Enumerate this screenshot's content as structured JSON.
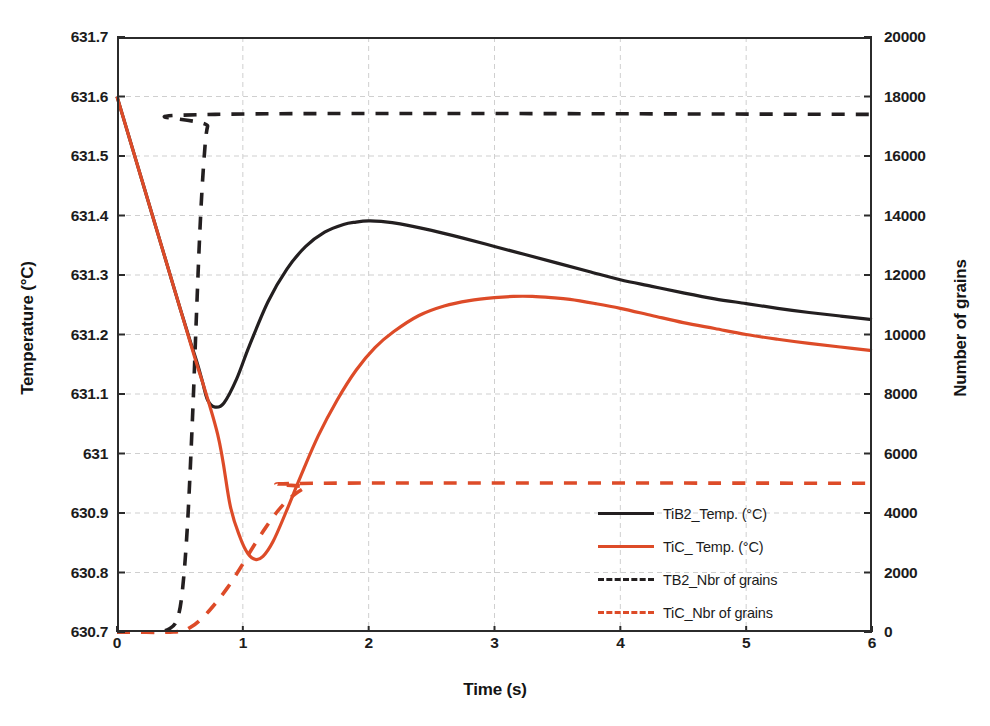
{
  "chart_data": {
    "type": "line",
    "title": "",
    "xlabel": "Time (s)",
    "ylabel": "Temperature (°C)",
    "y2label": "Number of grains",
    "xlim": [
      0,
      6
    ],
    "ylim": [
      630.7,
      631.7
    ],
    "y2lim": [
      0,
      20000
    ],
    "grid": true,
    "legend_position": "inside-right",
    "xticks": [
      "0",
      "1",
      "2",
      "3",
      "4",
      "5",
      "6"
    ],
    "xtick_values": [
      0,
      1,
      2,
      3,
      4,
      5,
      6
    ],
    "yticks": [
      "630.7",
      "630.8",
      "630.9",
      "631",
      "631.1",
      "631.2",
      "631.3",
      "631.4",
      "631.5",
      "631.6",
      "631.7"
    ],
    "ytick_values": [
      630.7,
      630.8,
      630.9,
      631.0,
      631.1,
      631.2,
      631.3,
      631.4,
      631.5,
      631.6,
      631.7
    ],
    "y2ticks": [
      "0",
      "2000",
      "4000",
      "6000",
      "8000",
      "10000",
      "12000",
      "14000",
      "16000",
      "18000",
      "20000"
    ],
    "y2tick_values": [
      0,
      2000,
      4000,
      6000,
      8000,
      10000,
      12000,
      14000,
      16000,
      18000,
      20000
    ],
    "colors": {
      "tib2": "#231f20",
      "tic": "#dd4b28",
      "axis": "#2b2b2b",
      "grid": "#cfcfcf"
    },
    "series": [
      {
        "name": "TiB2_Temp. (°C)",
        "axis": "left",
        "style": "solid",
        "color": "#231f20",
        "x": [
          0.0,
          0.1,
          0.2,
          0.3,
          0.4,
          0.5,
          0.58,
          0.64,
          0.68,
          0.72,
          0.78,
          0.85,
          0.95,
          1.05,
          1.2,
          1.35,
          1.5,
          1.65,
          1.8,
          1.9,
          2.0,
          2.1,
          2.25,
          2.5,
          2.75,
          3.0,
          3.25,
          3.5,
          3.75,
          4.0,
          4.25,
          4.5,
          4.75,
          5.0,
          5.25,
          5.5,
          5.75,
          6.0
        ],
        "y": [
          631.6,
          631.529,
          631.458,
          631.387,
          631.316,
          631.245,
          631.19,
          631.15,
          631.12,
          631.09,
          631.078,
          631.085,
          631.125,
          631.18,
          631.255,
          631.31,
          631.348,
          631.372,
          631.385,
          631.389,
          631.391,
          631.39,
          631.386,
          631.375,
          631.362,
          631.348,
          631.334,
          631.32,
          631.306,
          631.292,
          631.281,
          631.27,
          631.26,
          631.252,
          631.244,
          631.237,
          631.231,
          631.225
        ]
      },
      {
        "name": "TiC_ Temp. (°C)",
        "axis": "left",
        "style": "solid",
        "color": "#dd4b28",
        "x": [
          0.0,
          0.2,
          0.4,
          0.6,
          0.8,
          0.9,
          0.98,
          1.04,
          1.1,
          1.16,
          1.24,
          1.34,
          1.46,
          1.6,
          1.75,
          1.9,
          2.05,
          2.2,
          2.4,
          2.6,
          2.8,
          3.0,
          3.15,
          3.3,
          3.45,
          3.6,
          3.8,
          4.0,
          4.25,
          4.5,
          4.75,
          5.0,
          5.25,
          5.5,
          5.75,
          6.0
        ],
        "y": [
          631.6,
          631.458,
          631.316,
          631.174,
          631.032,
          630.912,
          630.858,
          630.832,
          630.822,
          630.827,
          630.852,
          630.9,
          630.962,
          631.03,
          631.09,
          631.14,
          631.178,
          631.205,
          631.232,
          631.248,
          631.257,
          631.262,
          631.264,
          631.264,
          631.262,
          631.259,
          631.252,
          631.244,
          631.232,
          631.22,
          631.21,
          631.2,
          631.192,
          631.185,
          631.179,
          631.173
        ]
      },
      {
        "name": "TB2_Nbr of grains",
        "axis": "right",
        "style": "dashed",
        "color": "#231f20",
        "x": [
          0.0,
          0.3,
          0.42,
          0.48,
          0.52,
          0.56,
          0.6,
          0.63,
          0.66,
          0.69,
          0.72,
          0.78,
          6.0
        ],
        "y": [
          0,
          0,
          120,
          450,
          1400,
          3600,
          7200,
          10500,
          13600,
          15800,
          17000,
          17400,
          17400
        ]
      },
      {
        "name": "TiC_Nbr of grains",
        "axis": "right",
        "style": "dashed",
        "color": "#dd4b28",
        "x": [
          0.0,
          0.45,
          0.58,
          0.68,
          0.78,
          0.88,
          0.98,
          1.08,
          1.18,
          1.28,
          1.38,
          1.5,
          1.62,
          6.0
        ],
        "y": [
          0,
          0,
          150,
          480,
          950,
          1500,
          2150,
          2850,
          3500,
          4080,
          4520,
          4860,
          5000,
          5000
        ]
      }
    ],
    "annotations": []
  },
  "legend": {
    "items": [
      {
        "label": "TiB2_Temp. (°C)",
        "color": "#231f20",
        "style": "solid"
      },
      {
        "label": "TiC_ Temp. (°C)",
        "color": "#dd4b28",
        "style": "solid"
      },
      {
        "label": "TB2_Nbr of grains",
        "color": "#231f20",
        "style": "dashed"
      },
      {
        "label": "TiC_Nbr of grains",
        "color": "#dd4b28",
        "style": "dashed"
      }
    ]
  }
}
